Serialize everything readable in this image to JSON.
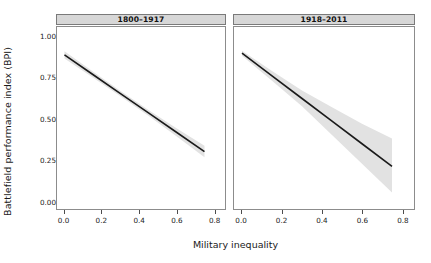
{
  "chart_data": {
    "type": "line",
    "title": "",
    "xlabel": "Military inequality",
    "ylabel": "Battlefield performance index (BPI)",
    "xlim": [
      -0.04,
      0.86
    ],
    "ylim": [
      -0.05,
      1.06
    ],
    "xticks": [
      0.0,
      0.2,
      0.4,
      0.6,
      0.8
    ],
    "xtick_labels": [
      "0.0",
      "0.2",
      "0.4",
      "0.6",
      "0.8"
    ],
    "yticks": [
      0.0,
      0.25,
      0.5,
      0.75,
      1.0
    ],
    "ytick_labels": [
      "0.00",
      "0.25",
      "0.50",
      "0.75",
      "1.00"
    ],
    "grid": false,
    "legend": "none",
    "facet_layout": "1x2",
    "line_color": "#1a1a1a",
    "band_color": "#e2e2e2",
    "strip_color": "#d7d7d7",
    "panels": [
      {
        "id": "panel-1",
        "strip_label": "1800–1917",
        "series": [
          {
            "name": "fitted BPI",
            "x": [
              0.0,
              0.15,
              0.3,
              0.45,
              0.6,
              0.75
            ],
            "y": [
              0.89,
              0.772,
              0.654,
              0.536,
              0.418,
              0.3
            ]
          }
        ],
        "confidence_band": {
          "name": "95% CI",
          "x": [
            0.0,
            0.15,
            0.3,
            0.45,
            0.6,
            0.75
          ],
          "upper": [
            0.912,
            0.79,
            0.67,
            0.554,
            0.443,
            0.335
          ],
          "lower": [
            0.868,
            0.754,
            0.638,
            0.518,
            0.393,
            0.265
          ]
        }
      },
      {
        "id": "panel-2",
        "strip_label": "1918–2011",
        "series": [
          {
            "name": "fitted BPI",
            "x": [
              0.0,
              0.15,
              0.3,
              0.45,
              0.6,
              0.75
            ],
            "y": [
              0.9,
              0.762,
              0.624,
              0.486,
              0.348,
              0.21
            ]
          }
        ],
        "confidence_band": {
          "name": "95% CI",
          "x": [
            0.0,
            0.15,
            0.3,
            0.45,
            0.6,
            0.75
          ],
          "upper": [
            0.915,
            0.792,
            0.672,
            0.57,
            0.47,
            0.38
          ],
          "lower": [
            0.885,
            0.732,
            0.576,
            0.402,
            0.226,
            0.05
          ]
        }
      }
    ]
  },
  "axes": {
    "y_title": "Battlefield performance index (BPI)",
    "x_title": "Military inequality"
  }
}
